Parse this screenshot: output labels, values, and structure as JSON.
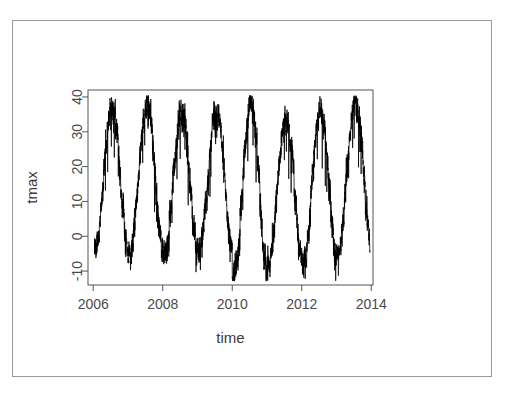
{
  "figure": {
    "ghost_caption": "",
    "background_color": "#ffffff",
    "frame_color": "#9a9aa0",
    "axis_color": "#555555",
    "tick_label_color": "#4a4a4a",
    "axis_label_color": "#3c3c3c",
    "series_color": "#000000"
  },
  "chart_data": {
    "type": "line",
    "title": "",
    "xlabel": "time",
    "ylabel": "tmax",
    "xlim": [
      2005.85,
      2014.05
    ],
    "ylim": [
      -14,
      42
    ],
    "xticks": [
      2006,
      2008,
      2010,
      2012,
      2014
    ],
    "xtick_labels": [
      "2006",
      "2008",
      "2010",
      "2012",
      "2014"
    ],
    "yticks": [
      -10,
      0,
      10,
      20,
      30,
      40
    ],
    "ytick_labels": [
      "-10",
      "0",
      "10",
      "20",
      "30",
      "40"
    ],
    "grid": false,
    "legend": null,
    "x_start": 2006.04,
    "x_end": 2013.96,
    "samples_per_year": 365,
    "seasonal": {
      "mean_level": 16.0,
      "amplitude": 16.5,
      "peak_phase_fraction": 0.54,
      "daily_noise_sd": 4.2,
      "weekly_noise_sd": 2.2
    },
    "annual_cycles": [
      {
        "year": 2006,
        "summer_peak": 37.0,
        "winter_trough": -4.0
      },
      {
        "year": 2007,
        "summer_peak": 37.5,
        "winter_trough": -5.0
      },
      {
        "year": 2008,
        "summer_peak": 35.0,
        "winter_trough": -5.5
      },
      {
        "year": 2009,
        "summer_peak": 36.0,
        "winter_trough": -4.5
      },
      {
        "year": 2010,
        "summer_peak": 38.5,
        "winter_trough": -12.0
      },
      {
        "year": 2011,
        "summer_peak": 34.5,
        "winter_trough": -7.5
      },
      {
        "year": 2012,
        "summer_peak": 36.5,
        "winter_trough": -8.5
      },
      {
        "year": 2013,
        "summer_peak": 39.5,
        "winter_trough": -5.0
      }
    ],
    "series": [
      {
        "name": "tmax",
        "color": "#000000",
        "line_width": 0.75,
        "notes": "single black polyline, no markers"
      }
    ]
  }
}
